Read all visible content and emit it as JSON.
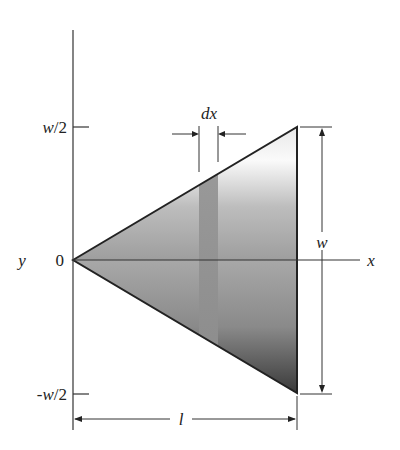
{
  "figure": {
    "type": "triangular plate with differential strip",
    "axis_labels": {
      "x": "x",
      "y": "y"
    },
    "origin_label": "0",
    "ticks": {
      "top": "w/2",
      "bottom": "-w/2"
    },
    "dimensions": {
      "strip_width": "dx",
      "base_width": "w",
      "length": "l"
    },
    "colors": {
      "line": "#222222",
      "plate_light": "#f2f2f2",
      "plate_mid": "#b0b0b0",
      "plate_dark": "#4a4a4a",
      "strip": "#9a9a9a"
    }
  }
}
